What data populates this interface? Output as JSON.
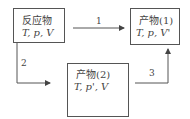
{
  "nodes": [
    {
      "id": "reactant",
      "title": "反应物",
      "vars": "T, p, V"
    },
    {
      "id": "product1",
      "title": "产物(1)",
      "vars": "T, p, V'"
    },
    {
      "id": "product2",
      "title": "产物(2)",
      "vars": "T, p', V"
    }
  ],
  "edges": [
    {
      "label": "1",
      "from": "reactant",
      "to": "product1"
    },
    {
      "label": "2",
      "from": "reactant",
      "to": "product2"
    },
    {
      "label": "3",
      "from": "product2",
      "to": "product1"
    }
  ]
}
